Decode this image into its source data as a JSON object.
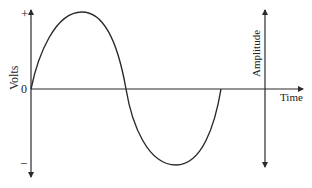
{
  "diagram": {
    "colors": {
      "line": "#2a2a2a",
      "text": "#222222",
      "background": "#ffffff"
    },
    "left_axis": {
      "label": "Volts",
      "plus_label": "+",
      "zero_label": "0",
      "minus_label": "−"
    },
    "time_axis": {
      "label": "Time"
    },
    "amplitude_axis": {
      "label": "Amplitude"
    },
    "wave": {
      "type": "sine",
      "cycles": 1,
      "points": {
        "start": [
          31,
          89
        ],
        "peak": [
          82,
          12
        ],
        "zero_cross": [
          126,
          89
        ],
        "trough": [
          176,
          165
        ],
        "end": [
          221,
          89
        ]
      }
    }
  }
}
